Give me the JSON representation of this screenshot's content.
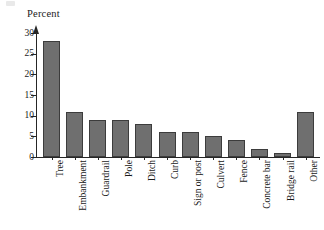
{
  "chart_data": {
    "type": "bar",
    "title": "",
    "ylabel": "Percent",
    "xlabel": "",
    "categories": [
      "Tree",
      "Embankment",
      "Guardrail",
      "Pole",
      "Ditch",
      "Curb",
      "Sign or post",
      "Culvert",
      "Fence",
      "Concrete bar",
      "Bridge rail",
      "Other"
    ],
    "values": [
      28,
      11,
      9,
      9,
      8,
      6,
      6,
      5,
      4,
      2,
      1,
      11
    ],
    "ylim": [
      0,
      30
    ],
    "yticks": [
      0,
      5,
      10,
      15,
      20,
      25,
      30
    ],
    "ytick_labels": [
      "0",
      "5",
      "10",
      "15",
      "20",
      "25",
      "30"
    ],
    "grid": false,
    "legend": null,
    "bar_color": "#6f6f6f",
    "bar_border_color": "#3c3c3c",
    "axis_color": "#262626"
  }
}
